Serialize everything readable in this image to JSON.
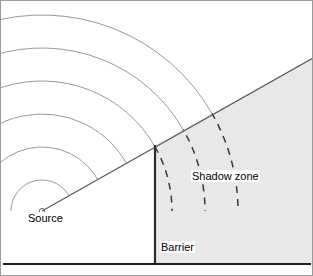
{
  "figure": {
    "width": 313,
    "height": 276,
    "background_color": "#ffffff",
    "border_color": "#9a9a9a"
  },
  "labels": {
    "source": "Source",
    "shadow_zone": "Shadow zone",
    "barrier": "Barrier"
  },
  "colors": {
    "wavefront_solid": "#8c8c8c",
    "wavefront_dashed": "#3a3a3a",
    "ray_line": "#555555",
    "barrier_line": "#2b2b2b",
    "ground_line": "#222222",
    "shadow_fill": "#e8e8e8",
    "source_marker": "#555555",
    "text": "#000000"
  },
  "geometry": {
    "source": {
      "x": 42,
      "y": 211,
      "marker_radius": 2.6
    },
    "ground_line": {
      "x1": 3,
      "y1": 264,
      "x2": 311,
      "y2": 264,
      "width": 2.2
    },
    "barrier_line": {
      "x": 155,
      "y_top": 145,
      "y_bottom": 264,
      "width": 2.2
    },
    "shadow_boundary_ray": {
      "x1": 42,
      "y1": 211,
      "x2": 313,
      "y2": 58,
      "width": 1.1
    },
    "shadow_polygon": "155,145 313,58 313,264 155,264",
    "wavefront_radii": [
      31,
      64,
      97,
      130,
      163,
      196
    ],
    "dash_pattern": "7 6",
    "arc_angle_start_deg": 180,
    "arc_angle_end_deg": 270
  }
}
